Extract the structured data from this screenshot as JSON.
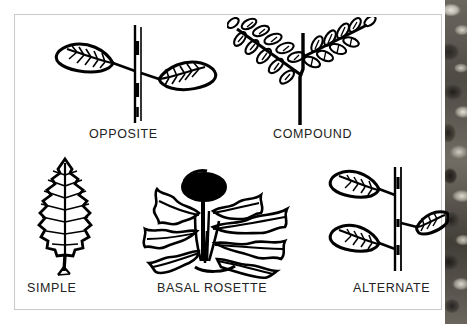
{
  "figure": {
    "background_color": "#ffffff",
    "frame_border_color": "#c9c9c9",
    "ink_color": "#000000",
    "side_strip": {
      "name": "photo-strip",
      "description": "dark mottled grayscale photographic band along right edge",
      "base_color": "#5a564f"
    }
  },
  "panels": [
    {
      "id": "opposite",
      "label": "OPPOSITE",
      "drawing": "opposite-leaves-drawing",
      "description": "vertical stem with two simple leaves attached at the same node, one pointing left and one pointing right",
      "leaf_count": 2
    },
    {
      "id": "compound",
      "label": "COMPOUND",
      "drawing": "compound-leaf-drawing",
      "description": "stem bearing two pinnately compound leaves, each made of many small paired leaflets along a rachis",
      "leaf_count": 2
    },
    {
      "id": "simple",
      "label": "SIMPLE",
      "drawing": "simple-leaf-drawing",
      "description": "single ovate leaf with a serrated margin, pinnate venation and a short petiole",
      "leaf_count": 1
    },
    {
      "id": "basal-rosette",
      "label": "BASAL ROSETTE",
      "drawing": "basal-rosette-drawing",
      "description": "dandelion-like plant with deeply lobed leaves radiating from the ground and a dark flower head on a central stalk",
      "leaf_count": 7
    },
    {
      "id": "alternate",
      "label": "ALTERNATE",
      "drawing": "alternate-leaves-drawing",
      "description": "vertical stem with three simple leaves attached singly at staggered nodes, alternating left and right",
      "leaf_count": 3
    }
  ]
}
